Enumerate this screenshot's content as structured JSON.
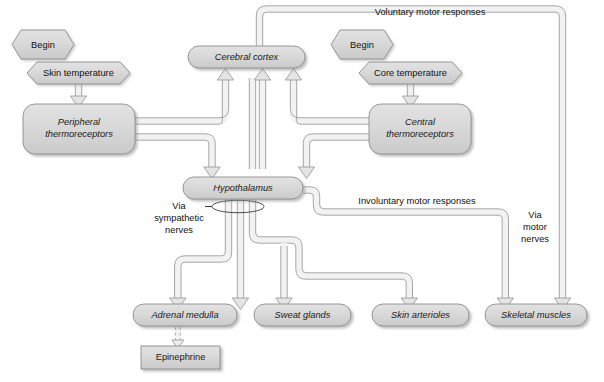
{
  "diagram": {
    "type": "flowchart",
    "title_visible": false,
    "background_color": "#ffffff",
    "node_fill": "#d8d8d8",
    "node_stroke": "#8a8a8a",
    "pipe_fill": "#d2d2d2",
    "pipe_stroke": "#9a9a9a",
    "start_nodes": [
      {
        "id": "begin-left",
        "label": "Begin",
        "shape": "hexagon"
      },
      {
        "id": "begin-right",
        "label": "Begin",
        "shape": "hexagon"
      }
    ],
    "stimulus_nodes": [
      {
        "id": "skin-temperature",
        "label": "Skin temperature",
        "shape": "hexagon"
      },
      {
        "id": "core-temperature",
        "label": "Core temperature",
        "shape": "hexagon"
      }
    ],
    "receptor_nodes": [
      {
        "id": "peripheral-thermoreceptors",
        "label_line1": "Peripheral",
        "label_line2": "thermoreceptors",
        "shape": "rounded-rect",
        "italic": true
      },
      {
        "id": "central-thermoreceptors",
        "label_line1": "Central",
        "label_line2": "thermoreceptors",
        "shape": "rounded-rect",
        "italic": true
      }
    ],
    "integration_nodes": [
      {
        "id": "cerebral-cortex",
        "label": "Cerebral cortex",
        "shape": "stadium",
        "italic": true
      },
      {
        "id": "hypothalamus",
        "label": "Hypothalamus",
        "shape": "stadium",
        "italic": true
      }
    ],
    "effector_nodes": [
      {
        "id": "adrenal-medulla",
        "label": "Adrenal medulla",
        "shape": "stadium",
        "italic": true
      },
      {
        "id": "sweat-glands",
        "label": "Sweat glands",
        "shape": "stadium",
        "italic": true
      },
      {
        "id": "skin-arterioles",
        "label": "Skin arterioles",
        "shape": "stadium",
        "italic": true
      },
      {
        "id": "skeletal-muscles",
        "label": "Skeletal muscles",
        "shape": "stadium",
        "italic": true
      }
    ],
    "product_nodes": [
      {
        "id": "epinephrine",
        "label": "Epinephrine",
        "shape": "rect",
        "italic": false
      }
    ],
    "pathway_labels": [
      {
        "id": "voluntary-motor-responses",
        "label": "Voluntary motor responses"
      },
      {
        "id": "involuntary-motor-responses",
        "label": "Involuntary motor responses"
      },
      {
        "id": "via-sympathetic-nerves",
        "line1": "Via",
        "line2": "sympathetic",
        "line3": "nerves"
      },
      {
        "id": "via-motor-nerves",
        "line1": "Via",
        "line2": "motor",
        "line3": "nerves"
      }
    ]
  }
}
